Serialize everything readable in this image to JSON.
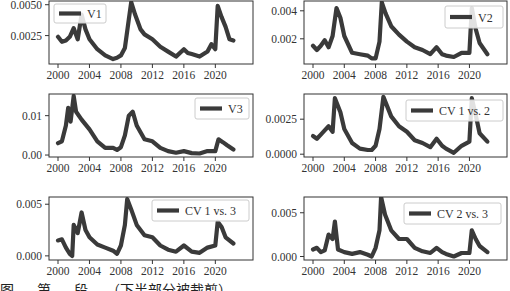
{
  "chart_data": [
    {
      "type": "line",
      "title": "",
      "legend": "V1",
      "legend_position": "upper left",
      "xlabel": "",
      "ylabel": "",
      "xlim": [
        2000,
        2022.5
      ],
      "ylim": [
        0.0002,
        0.0053
      ],
      "xticks": [
        2000,
        2004,
        2008,
        2012,
        2016,
        2020
      ],
      "yticks": [
        0.0025,
        0.005
      ],
      "ytick_labels": [
        "0.0025",
        "0.0050"
      ],
      "x": [
        2000,
        2000.5,
        2001,
        2001.5,
        2002,
        2002.5,
        2003,
        2003.5,
        2004,
        2005,
        2006,
        2007,
        2007.5,
        2008,
        2008.5,
        2009,
        2009.3,
        2009.8,
        2010.5,
        2011,
        2012,
        2013,
        2014,
        2015,
        2016,
        2016.5,
        2017,
        2018,
        2019,
        2019.5,
        2020,
        2020.3,
        2020.8,
        2021.3,
        2021.8,
        2022.3
      ],
      "values": [
        0.0024,
        0.002,
        0.0021,
        0.0024,
        0.0031,
        0.0022,
        0.0042,
        0.003,
        0.0022,
        0.0014,
        0.0009,
        0.0006,
        0.0007,
        0.0009,
        0.0015,
        0.0038,
        0.0052,
        0.0042,
        0.003,
        0.0026,
        0.0022,
        0.0016,
        0.0012,
        0.0008,
        0.0014,
        0.0011,
        0.001,
        0.0008,
        0.0012,
        0.0018,
        0.0014,
        0.0049,
        0.004,
        0.0032,
        0.0022,
        0.0021
      ]
    },
    {
      "type": "line",
      "title": "",
      "legend": "V2",
      "legend_position": "upper right",
      "xlabel": "",
      "ylabel": "",
      "xlim": [
        2000,
        2022.5
      ],
      "ylim": [
        0.0002,
        0.0047
      ],
      "xticks": [
        2000,
        2004,
        2008,
        2012,
        2016,
        2020
      ],
      "yticks": [
        0.002,
        0.004
      ],
      "ytick_labels": [
        "0.002",
        "0.004"
      ],
      "x": [
        2000,
        2000.5,
        2001,
        2001.5,
        2002,
        2002.5,
        2003,
        2003.5,
        2004,
        2005,
        2006,
        2007,
        2007.5,
        2008,
        2008.5,
        2008.8,
        2009.3,
        2010,
        2011,
        2012,
        2013,
        2014,
        2015,
        2015.8,
        2016.5,
        2017,
        2018,
        2019,
        2020,
        2020.3,
        2020.8,
        2021.3,
        2022.3
      ],
      "values": [
        0.0015,
        0.0012,
        0.0015,
        0.0019,
        0.0014,
        0.0022,
        0.0042,
        0.0035,
        0.0022,
        0.001,
        0.0009,
        0.0008,
        0.0006,
        0.0006,
        0.0018,
        0.0046,
        0.0038,
        0.0029,
        0.0023,
        0.0018,
        0.0014,
        0.0012,
        0.0009,
        0.0014,
        0.0009,
        0.0008,
        0.0007,
        0.001,
        0.001,
        0.0042,
        0.0027,
        0.0017,
        0.0009
      ]
    },
    {
      "type": "line",
      "title": "",
      "legend": "V3",
      "legend_position": "upper right",
      "xlabel": "",
      "ylabel": "",
      "xlim": [
        2000,
        2022.5
      ],
      "ylim": [
        -0.0005,
        0.0155
      ],
      "xticks": [
        2000,
        2004,
        2008,
        2012,
        2016,
        2020
      ],
      "yticks": [
        0.0,
        0.01
      ],
      "ytick_labels": [
        "0.00",
        "0.01"
      ],
      "x": [
        2000,
        2000.5,
        2001,
        2001.3,
        2001.6,
        2002,
        2002.3,
        2003,
        2004,
        2005,
        2006,
        2007,
        2007.5,
        2008,
        2008.5,
        2009,
        2009.5,
        2010,
        2011,
        2012,
        2013,
        2014,
        2015,
        2016,
        2017,
        2018,
        2019,
        2020,
        2020.4,
        2021,
        2021.5,
        2022.3
      ],
      "values": [
        0.003,
        0.0035,
        0.0075,
        0.012,
        0.0085,
        0.015,
        0.011,
        0.009,
        0.0065,
        0.0035,
        0.0018,
        0.0018,
        0.0013,
        0.002,
        0.005,
        0.01,
        0.011,
        0.0075,
        0.004,
        0.0035,
        0.0018,
        0.001,
        0.0006,
        0.001,
        0.0005,
        0.0004,
        0.001,
        0.001,
        0.004,
        0.0032,
        0.0025,
        0.0014
      ]
    },
    {
      "type": "line",
      "title": "",
      "legend": "CV 1 vs. 2",
      "legend_position": "upper right",
      "xlabel": "",
      "ylabel": "",
      "xlim": [
        2000,
        2022.5
      ],
      "ylim": [
        -0.0002,
        0.0043
      ],
      "xticks": [
        2000,
        2004,
        2008,
        2012,
        2016,
        2020
      ],
      "yticks": [
        0.0,
        0.0025
      ],
      "ytick_labels": [
        "0.0000",
        "0.0025"
      ],
      "x": [
        2000,
        2000.5,
        2001,
        2001.5,
        2002,
        2002.5,
        2002.8,
        2003.5,
        2004,
        2005,
        2006,
        2007,
        2007.5,
        2008,
        2008.5,
        2009,
        2009.5,
        2010,
        2011,
        2012,
        2013,
        2014,
        2015,
        2015.8,
        2016.5,
        2017,
        2018,
        2019,
        2020,
        2020.3,
        2020.8,
        2021.3,
        2022.3
      ],
      "values": [
        0.0013,
        0.0011,
        0.0014,
        0.0017,
        0.002,
        0.0016,
        0.004,
        0.003,
        0.0018,
        0.0008,
        0.0004,
        0.0003,
        0.0003,
        0.0006,
        0.0018,
        0.0041,
        0.0034,
        0.0027,
        0.002,
        0.0016,
        0.001,
        0.0008,
        0.0005,
        0.0011,
        0.0006,
        0.0004,
        0.0001,
        0.0006,
        0.0009,
        0.004,
        0.0028,
        0.0015,
        0.0009
      ]
    },
    {
      "type": "line",
      "title": "",
      "legend": "CV 1 vs. 3",
      "legend_position": "upper right",
      "xlabel": "",
      "ylabel": "",
      "xlim": [
        2000,
        2022.5
      ],
      "ylim": [
        -0.0004,
        0.0057
      ],
      "xticks": [
        2000,
        2004,
        2008,
        2012,
        2016,
        2020
      ],
      "yticks": [
        0.0,
        0.005
      ],
      "ytick_labels": [
        "0.000",
        "0.005"
      ],
      "x": [
        2000,
        2000.5,
        2001,
        2001.5,
        2001.8,
        2002,
        2002.5,
        2003,
        2003.5,
        2004,
        2005,
        2006,
        2007,
        2007.5,
        2008,
        2008.5,
        2008.8,
        2009.3,
        2010,
        2011,
        2012,
        2013,
        2014,
        2015,
        2016,
        2017,
        2018,
        2019,
        2020,
        2020.3,
        2020.8,
        2021.3,
        2022.3
      ],
      "values": [
        0.0015,
        0.0016,
        0.0008,
        0.0002,
        0.0,
        0.003,
        0.0022,
        0.0042,
        0.0025,
        0.0018,
        0.0011,
        0.0008,
        0.0005,
        0.0002,
        0.001,
        0.003,
        0.0055,
        0.0045,
        0.003,
        0.002,
        0.0018,
        0.001,
        0.0006,
        0.0004,
        0.001,
        0.0004,
        0.0003,
        0.0008,
        0.001,
        0.0033,
        0.0028,
        0.0018,
        0.0012
      ]
    },
    {
      "type": "line",
      "title": "",
      "legend": "CV 2 vs. 3",
      "legend_position": "upper right",
      "xlabel": "",
      "ylabel": "",
      "xlim": [
        2000,
        2022.5
      ],
      "ylim": [
        -0.0004,
        0.0068
      ],
      "xticks": [
        2000,
        2004,
        2008,
        2012,
        2016,
        2020
      ],
      "yticks": [
        0.0,
        0.005
      ],
      "ytick_labels": [
        "0.000",
        "0.005"
      ],
      "x": [
        2000,
        2000.5,
        2001,
        2001.5,
        2002,
        2002.5,
        2002.8,
        2003.2,
        2004,
        2005,
        2006,
        2007,
        2007.5,
        2008,
        2008.5,
        2008.7,
        2009.2,
        2010,
        2011,
        2012,
        2013,
        2014,
        2015,
        2015.8,
        2016.5,
        2017,
        2018,
        2019,
        2020,
        2020.3,
        2020.8,
        2021.3,
        2022.3
      ],
      "values": [
        0.0008,
        0.001,
        0.0005,
        0.0007,
        0.0025,
        0.002,
        0.004,
        0.0008,
        0.0005,
        0.0003,
        0.0005,
        0.0002,
        0.0,
        0.001,
        0.003,
        0.0068,
        0.0048,
        0.003,
        0.002,
        0.002,
        0.001,
        0.0006,
        0.0004,
        0.001,
        0.0005,
        0.0003,
        0.0,
        0.0004,
        0.0004,
        0.003,
        0.002,
        0.0012,
        0.0005
      ]
    }
  ],
  "caption": {
    "text": "图 … 第 … 段 …（下半部分被裁剪）"
  }
}
